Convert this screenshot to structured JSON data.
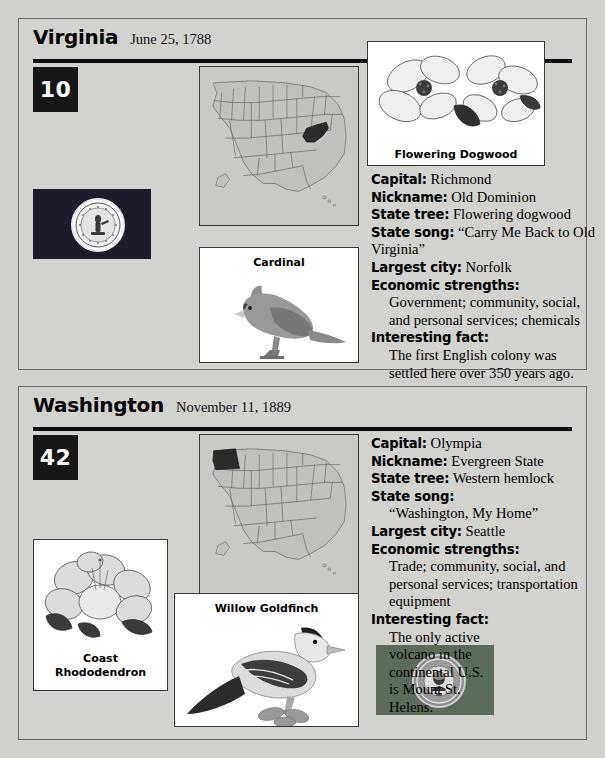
{
  "cards": [
    {
      "state": "Virginia",
      "date": "June 25, 1788",
      "rank": "10",
      "flag_name": "virginia-state-flag",
      "map_name": "united-states-map-virginia-highlighted",
      "flower": {
        "caption": "Flowering Dogwood"
      },
      "bird": {
        "caption": "Cardinal"
      },
      "facts": [
        {
          "label": "Capital:",
          "value": "Richmond"
        },
        {
          "label": "Nickname:",
          "value": "Old Dominion"
        },
        {
          "label": "State tree:",
          "value": "Flowering dogwood"
        },
        {
          "label": "State song:",
          "value": "“Carry Me Back to Old Virginia”"
        },
        {
          "label": "Largest city:",
          "value": "Norfolk"
        },
        {
          "label": "Economic strengths:",
          "value": "Government; community, social, and personal services; chemicals"
        },
        {
          "label": "Interesting fact:",
          "value": "The first English colony was settled here over 350 years ago."
        }
      ]
    },
    {
      "state": "Washington",
      "date": "November 11, 1889",
      "rank": "42",
      "flag_name": "washington-state-flag",
      "map_name": "united-states-map-washington-highlighted",
      "flower": {
        "caption_line1": "Coast",
        "caption_line2": "Rhododendron"
      },
      "bird": {
        "caption": "Willow Goldfinch"
      },
      "facts": [
        {
          "label": "Capital:",
          "value": "Olympia"
        },
        {
          "label": "Nickname:",
          "value": "Evergreen State"
        },
        {
          "label": "State tree:",
          "value": "Western hemlock"
        },
        {
          "label": "State song:",
          "value": "“Washington, My Home”"
        },
        {
          "label": "Largest city:",
          "value": "Seattle"
        },
        {
          "label": "Economic strengths:",
          "value": "Trade; community, social, and personal services; transportation equipment"
        },
        {
          "label": "Interesting fact:",
          "value": "The only active volcano in the continental U.S. is Mount St. Helens."
        }
      ]
    }
  ],
  "colors": {
    "page_background": "#d0d0cc",
    "card_background": "#d2d2ce",
    "rule": "#111111",
    "badge_background": "#161616",
    "badge_text": "#ffffff",
    "map_land": "#c0c0bc",
    "map_highlight": "#2b2b2b",
    "flag_virginia": "#1b1b2a",
    "flag_washington": "#5d6b5d"
  }
}
